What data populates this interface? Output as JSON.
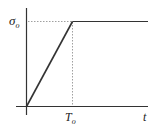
{
  "diagram": {
    "type": "ramp-hold function plot",
    "y_axis_label": "σ",
    "y_axis_label_sub": "o",
    "x_axis_label": "t",
    "x_marker_label": "T",
    "x_marker_label_sub": "o",
    "segments": [
      {
        "name": "ramp",
        "from": [
          0,
          0
        ],
        "to": [
          "T_o",
          "σ_o"
        ]
      },
      {
        "name": "hold",
        "from": [
          "T_o",
          "σ_o"
        ],
        "to": [
          "t_end",
          "σ_o"
        ]
      }
    ],
    "colors": {
      "line": "#333333",
      "dotted": "#888888",
      "background": "#ffffff"
    }
  }
}
